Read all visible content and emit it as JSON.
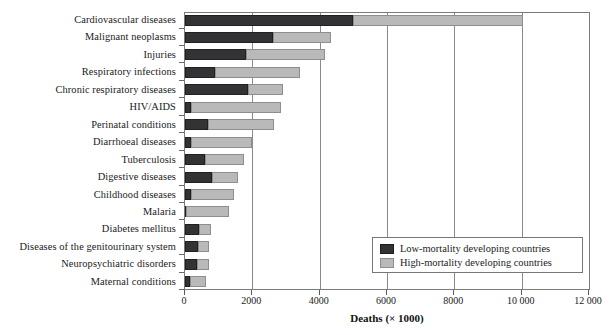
{
  "chart_data": {
    "type": "bar",
    "orientation": "horizontal",
    "stacked": true,
    "title": "",
    "xlabel": "Deaths (× 1000)",
    "ylabel": "",
    "xlim": [
      0,
      12000
    ],
    "xticks": [
      0,
      2000,
      4000,
      6000,
      8000,
      10000,
      12000
    ],
    "xtick_labels": [
      "0",
      "2000",
      "4000",
      "6000",
      "8000",
      "10 000",
      "12 000"
    ],
    "grid": "vertical",
    "legend_position": "bottom-right",
    "categories": [
      "Cardiovascular diseases",
      "Malignant neoplasms",
      "Injuries",
      "Respiratory infections",
      "Chronic respiratory diseases",
      "HIV/AIDS",
      "Perinatal conditions",
      "Diarrhoeal diseases",
      "Tuberculosis",
      "Digestive diseases",
      "Childhood diseases",
      "Malaria",
      "Diabetes mellitus",
      "Diseases of the genitourinary system",
      "Neuropsychiatric disorders",
      "Maternal conditions"
    ],
    "series": [
      {
        "name": "Low-mortality developing countries",
        "color": "#333335",
        "values": [
          5000,
          2600,
          1800,
          880,
          1880,
          180,
          680,
          180,
          590,
          800,
          190,
          30,
          410,
          380,
          350,
          150
        ]
      },
      {
        "name": "High-mortality developing countries",
        "color": "#b9b9b9",
        "values": [
          5050,
          1750,
          2350,
          2540,
          1040,
          2680,
          1970,
          1820,
          1150,
          760,
          1260,
          1270,
          360,
          330,
          360,
          470
        ]
      }
    ],
    "totals": [
      10050,
      4350,
      4150,
      3420,
      2920,
      2860,
      2650,
      2000,
      1740,
      1560,
      1450,
      1300,
      770,
      710,
      710,
      620
    ]
  },
  "legend": {
    "items": [
      {
        "label": "Low-mortality developing countries",
        "color": "#333335"
      },
      {
        "label": "High-mortality developing countries",
        "color": "#b9b9b9"
      }
    ]
  }
}
